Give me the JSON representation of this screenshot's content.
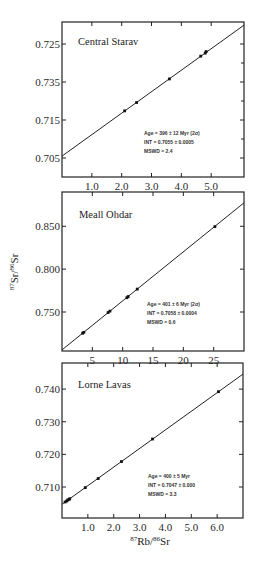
{
  "chart_data": [
    {
      "type": "scatter",
      "title": "Central Starav",
      "xlabel": "",
      "ylabel": "",
      "xlim": [
        0,
        6.1
      ],
      "ylim": [
        0.7,
        0.7385
      ],
      "x_ticks": [
        1.0,
        2.0,
        3.0,
        4.0,
        5.0
      ],
      "x_tick_labels": [
        "1.0",
        "2.0",
        "3.0",
        "4.0",
        "5.0"
      ],
      "y_ticks": [
        0.735,
        0.725,
        0.715,
        0.705
      ],
      "y_tick_labels": [
        "0.725",
        "0.735",
        "0.715",
        "0.705"
      ],
      "points": {
        "x": [
          2.1,
          2.5,
          3.6,
          4.65,
          4.8,
          4.83
        ],
        "y": [
          0.7174,
          0.7196,
          0.7258,
          0.7318,
          0.7326,
          0.733
        ]
      },
      "fit_line": {
        "intercept": 0.7055,
        "slope": 0.00565
      },
      "annotations": [
        "Age = 396 ± 12 Myr (2σ)",
        "INT = 0.7055 ± 0.0005",
        "MSWD = 2.4"
      ]
    },
    {
      "type": "scatter",
      "title": "Meall Ohdar",
      "xlabel": "",
      "ylabel": "87Sr/86Sr",
      "xlim": [
        0,
        30
      ],
      "ylim": [
        0.7045,
        0.89
      ],
      "x_ticks": [
        5,
        10,
        15,
        20,
        25
      ],
      "x_tick_labels": [
        "5",
        "10",
        "15",
        "20",
        "25"
      ],
      "y_ticks": [
        0.85,
        0.8,
        0.75
      ],
      "y_tick_labels": [
        "0.850",
        "0.800",
        "0.750"
      ],
      "points": {
        "x": [
          3.4,
          3.6,
          7.6,
          7.9,
          10.7,
          10.9,
          12.4,
          25.2
        ],
        "y": [
          0.7252,
          0.7263,
          0.7494,
          0.751,
          0.7667,
          0.768,
          0.7767,
          0.8496
        ]
      },
      "fit_line": {
        "intercept": 0.7058,
        "slope": 0.00572
      },
      "annotations": [
        "Age = 401 ± 6 Myr (2σ)",
        "INT = 0.7058 ± 0.0004",
        "MSWD = 0.6"
      ]
    },
    {
      "type": "scatter",
      "title": "Lorne Lavas",
      "xlabel": "87Rb/86Sr",
      "ylabel": "",
      "xlim": [
        0,
        7.0
      ],
      "ylim": [
        0.7005,
        0.748
      ],
      "x_ticks": [
        1.0,
        2.0,
        3.0,
        4.0,
        5.0,
        6.0
      ],
      "x_tick_labels": [
        "1.0",
        "2.0",
        "3.0",
        "4.0",
        "5.0",
        "6.0"
      ],
      "y_ticks": [
        0.74,
        0.73,
        0.72,
        0.71
      ],
      "y_tick_labels": [
        "0.740",
        "0.730",
        "0.720",
        "0.710"
      ],
      "points": {
        "x": [
          0.12,
          0.18,
          0.22,
          0.27,
          0.3,
          0.9,
          1.4,
          2.3,
          3.5,
          6.05
        ],
        "y": [
          0.7054,
          0.7057,
          0.706,
          0.7062,
          0.7064,
          0.7098,
          0.7126,
          0.7178,
          0.7247,
          0.7392
        ]
      },
      "fit_line": {
        "intercept": 0.7047,
        "slope": 0.0057
      },
      "annotations": [
        "Age = 400 ± 5 Myr",
        "INT = 0.7047 ± 0.000",
        "MSWD = 3.3"
      ]
    }
  ],
  "figure": {
    "ylabel_main": "87Sr/86Sr",
    "xlabel_main": "87Rb/86Sr"
  }
}
